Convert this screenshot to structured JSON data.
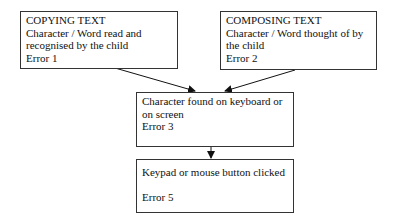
{
  "diagram": {
    "nodes": [
      {
        "id": "copying",
        "title": "COPYING TEXT",
        "lines": [
          "Character / Word read and",
          "recognised by the child"
        ],
        "error": "Error 1"
      },
      {
        "id": "composing",
        "title": "COMPOSING TEXT",
        "lines": [
          "Character / Word thought of by",
          "the child"
        ],
        "error": "Error 2"
      },
      {
        "id": "found",
        "lines": [
          "Character found on keyboard or",
          "on screen"
        ],
        "error": "Error 3"
      },
      {
        "id": "clicked",
        "lines": [
          "Keypad or mouse button clicked"
        ],
        "error": "Error 5"
      }
    ],
    "edges": [
      {
        "from": "copying",
        "to": "found"
      },
      {
        "from": "composing",
        "to": "found"
      },
      {
        "from": "found",
        "to": "clicked"
      }
    ]
  }
}
